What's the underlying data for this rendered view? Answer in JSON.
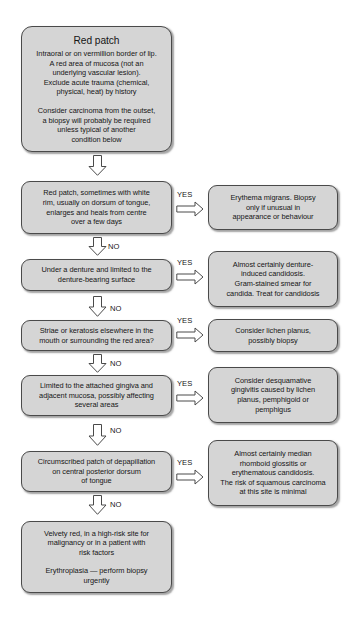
{
  "diagram": {
    "title_cut_off_top": "",
    "colors": {
      "node_fill": "#d5d5d5",
      "node_border": "#4a4a4a",
      "arrow_fill": "#ffffff",
      "arrow_border": "#4a4a4a",
      "page_background": "#ffffff",
      "text": "#161616"
    },
    "start_node": {
      "title": "Red patch",
      "paragraph_1": [
        "Intraoral or on vermillion border of lip.",
        "A red area of mucosa (not an",
        "underlying vascular lesion).",
        "Exclude acute trauma (chemical,",
        "physical, heat) by history"
      ],
      "paragraph_2": [
        "Consider carcinoma from the outset,",
        "a biopsy will probably be required",
        "unless typical of another",
        "condition below"
      ]
    },
    "decisions": [
      {
        "id": "erythema-migrans",
        "question": [
          "Red patch, sometimes with white",
          "rim, usually on dorsum of tongue,",
          "enlarges and heals from centre",
          "over a few days"
        ],
        "yes_label": "YES",
        "no_label": "NO",
        "outcome": [
          "Erythema migrans. Biopsy",
          "only if unusual in",
          "appearance or behaviour"
        ]
      },
      {
        "id": "denture-induced-candidosis",
        "question": [
          "Under a denture and limited to the",
          "denture-bearing surface"
        ],
        "yes_label": "YES",
        "no_label": "NO",
        "outcome": [
          "Almost certainly denture-",
          "induced candidosis.",
          "Gram-stained smear for",
          "candida. Treat for candidosis"
        ]
      },
      {
        "id": "lichen-planus",
        "question": [
          "Striae or keratosis elsewhere in the",
          "mouth or surrounding the red area?"
        ],
        "yes_label": "YES",
        "no_label": "NO",
        "outcome": [
          "Consider lichen planus,",
          "possibly biopsy"
        ]
      },
      {
        "id": "desquamative-gingivitis",
        "question": [
          "Limited to the attached gingiva and",
          "adjacent mucosa, possibly affecting",
          "several areas"
        ],
        "yes_label": "YES",
        "no_label": "NO",
        "outcome": [
          "Consider desquamative",
          "gingivitis caused by lichen",
          "planus, pemphigoid or",
          "pemphigus"
        ]
      },
      {
        "id": "median-rhomboid-glossitis",
        "question": [
          "Circumscribed patch of depapillation",
          "on central posterior dorsum",
          "of tongue"
        ],
        "yes_label": "YES",
        "no_label": "NO",
        "outcome": [
          "Almost certainly median",
          "rhomboid glossitis or",
          "erythematous candidosis.",
          "The risk of squamous carcinoma",
          "at this site is minimal"
        ]
      }
    ],
    "end_node": {
      "paragraph_1": [
        "Velvety red, in a high-risk site for",
        "malignancy or in a patient with",
        "risk factors"
      ],
      "paragraph_2": [
        "Erythroplasia — perform biopsy",
        "urgently"
      ]
    }
  }
}
